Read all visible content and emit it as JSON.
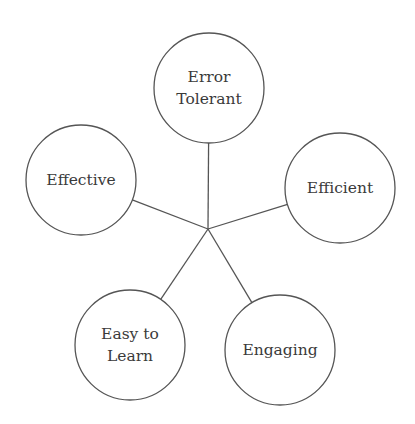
{
  "diagram": {
    "type": "hub-and-spoke",
    "hub": {
      "x": 208,
      "y": 229
    },
    "stroke_color": "#555555",
    "text_color": "#3a3a3a",
    "nodes": [
      {
        "id": "error-tolerant",
        "lines": [
          "Error",
          "Tolerant"
        ],
        "cx": 209,
        "cy": 88,
        "r": 55
      },
      {
        "id": "efficient",
        "lines": [
          "Efficient"
        ],
        "cx": 340,
        "cy": 188,
        "r": 55
      },
      {
        "id": "engaging",
        "lines": [
          "Engaging"
        ],
        "cx": 280,
        "cy": 350,
        "r": 55
      },
      {
        "id": "easy-to-learn",
        "lines": [
          "Easy to",
          "Learn"
        ],
        "cx": 130,
        "cy": 345,
        "r": 55
      },
      {
        "id": "effective",
        "lines": [
          "Effective"
        ],
        "cx": 81,
        "cy": 180,
        "r": 55
      }
    ]
  }
}
